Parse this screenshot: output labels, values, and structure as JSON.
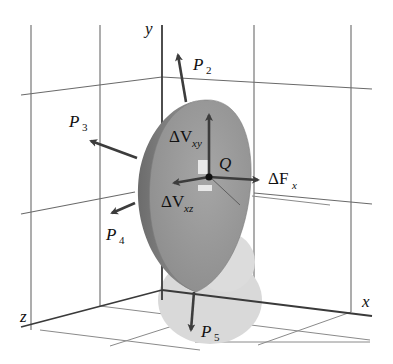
{
  "figure": {
    "axes": {
      "x": "x",
      "y": "y",
      "z": "z"
    },
    "point": "Q",
    "forces": [
      {
        "name": "P2",
        "base": "P",
        "sub": "2"
      },
      {
        "name": "P3",
        "base": "P",
        "sub": "3"
      },
      {
        "name": "P4",
        "base": "P",
        "sub": "4"
      },
      {
        "name": "P5",
        "base": "P",
        "sub": "5"
      }
    ],
    "internal_forces": [
      {
        "name": "ΔVxy",
        "base": "ΔV",
        "sub": "xy"
      },
      {
        "name": "ΔVxz",
        "base": "ΔV",
        "sub": "xz"
      },
      {
        "name": "ΔFx",
        "base": "ΔF",
        "sub": "x"
      }
    ],
    "colors": {
      "body": "#9a9a9a",
      "body_edge": "#6e6e6e",
      "shadow": "#d6d6d6",
      "arrow": "#3c3c3c",
      "grid": "#6a6a6a"
    }
  }
}
